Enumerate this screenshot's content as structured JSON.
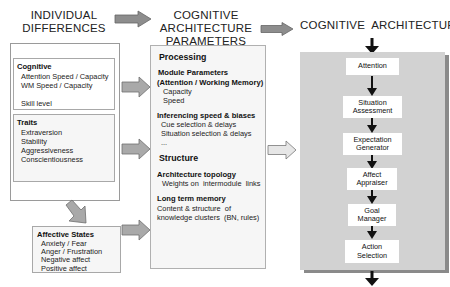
{
  "headings": {
    "individual_differences": [
      "INDIVIDUAL",
      "DIFFERENCES"
    ],
    "cognitive_architecture_parameters": [
      "COGNITIVE",
      "ARCHITECTURE",
      "PARAMETERS"
    ],
    "cognitive_architecture": "COGNITIVE  ARCHITECTURE"
  },
  "individual_differences": {
    "cognitive": {
      "title": "Cognitive",
      "items": [
        "Attention Speed / Capacity",
        "WM Speed / Capacity",
        "",
        "Skill level"
      ]
    },
    "traits": {
      "title": "Traits",
      "items": [
        "Extraversion",
        "Stability",
        "Aggressiveness",
        "Conscientiousness"
      ]
    },
    "affective_states": {
      "title": "Affective States",
      "items": [
        "Anxiety / Fear",
        "Anger / Frustration",
        "Negative affect",
        "Positive affect"
      ]
    }
  },
  "parameters": {
    "processing": {
      "title": "Processing",
      "module_parameters": {
        "title": [
          "Module Parameters",
          "(Attention / Working Memory)"
        ],
        "items": [
          "Capacity",
          "Speed"
        ]
      },
      "inferencing": {
        "title": "Inferencing  speed & biases",
        "items": [
          "Cue selection & delays",
          "Situation selection & delays",
          "..."
        ]
      }
    },
    "structure": {
      "title": "Structure",
      "architecture_topology": {
        "title": "Architecture topology",
        "items": [
          "Weights on  intermodule  links"
        ]
      },
      "long_term_memory": {
        "title": "Long term memory",
        "items": [
          "Content & structure  of",
          "knowledge clusters  (BN, rules)"
        ]
      }
    }
  },
  "architecture": {
    "modules": [
      [
        "Attention"
      ],
      [
        "Situation",
        "Assessment"
      ],
      [
        "Expectation",
        "Generator"
      ],
      [
        "Affect",
        "Appraiser"
      ],
      [
        "Goal",
        "Manager"
      ],
      [
        "Action",
        "Selection"
      ]
    ]
  },
  "colors": {
    "arrow_fill": "#a9a9a9",
    "arrow_stroke": "#6e6e6e",
    "panel_fill": "#d2d2d2",
    "panel_shadow": "#8a8a8a",
    "flow_arrow": "#111111"
  }
}
